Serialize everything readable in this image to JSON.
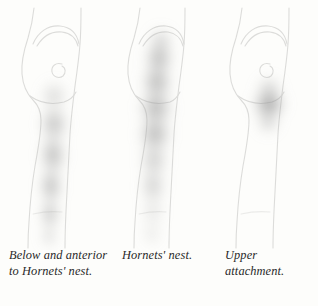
{
  "document": {
    "type": "anatomical-illustration",
    "subject": "Referred pain patterns of the posterior hip and thigh",
    "view": "lateral / posterolateral view of pelvis, hip and thigh",
    "background_color": "#fdfdfb",
    "outline_color": "#dcdcda",
    "shading_color": "#8e8e8e",
    "panel_count": 3
  },
  "panels": [
    {
      "id": "panel-1",
      "index": 1,
      "caption": "Below and anterior to Hornets' nest.",
      "caption_lines": [
        "Below and",
        "anterior to",
        "Hornets' nest."
      ],
      "pain_pattern": {
        "name": "below-and-anterior-pattern",
        "description": "Elongated diffuse band from below the greater trochanter running down the anterolateral thigh toward the knee",
        "extent": "lower trochanter to distal thigh",
        "intensity_peak": "mid thigh",
        "max_opacity": 0.62
      },
      "anatomy_landmarks": [
        "iliac crest",
        "buttock contour",
        "greater trochanter spiral",
        "lateral thigh",
        "knee"
      ]
    },
    {
      "id": "panel-2",
      "index": 2,
      "caption": "Hornets' nest.",
      "caption_lines": [
        "Hornets' nest."
      ],
      "pain_pattern": {
        "name": "hornets-nest-pattern",
        "description": "Broad vertical band covering the posterior gluteal region and running the full length of the posterior thigh",
        "extent": "iliac crest to distal posterior thigh",
        "intensity_peak": "upper gluteal and mid posterior thigh",
        "max_opacity": 0.7
      },
      "anatomy_landmarks": [
        "iliac crest",
        "buttock contour",
        "posterior thigh",
        "knee"
      ]
    },
    {
      "id": "panel-3",
      "index": 3,
      "caption": "Upper attachment.",
      "caption_lines": [
        "Upper",
        "attachment."
      ],
      "pain_pattern": {
        "name": "upper-attachment-pattern",
        "description": "Concentrated round blot centred over the greater trochanter / upper gluteal attachment",
        "extent": "localised at greater trochanter",
        "intensity_peak": "greater trochanter",
        "max_opacity": 0.75
      },
      "anatomy_landmarks": [
        "iliac crest",
        "buttock contour",
        "greater trochanter spiral",
        "upper thigh"
      ]
    }
  ]
}
